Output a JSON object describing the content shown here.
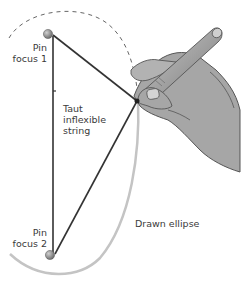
{
  "labels": {
    "pin_focus_1": [
      "Pin",
      "focus 1"
    ],
    "string": [
      "Taut",
      "inflexible",
      "string"
    ],
    "pin_focus_2": [
      "Pin",
      "focus 2"
    ],
    "ellipse": "Drawn ellipse"
  },
  "colors": {
    "string": "#333333",
    "ellipse": "#c4c4c4",
    "dashed_arc": "#666666",
    "pin": "#8a8a8a",
    "hand": "#a6a6a6",
    "pencil": "#9a9a9a",
    "label": "#3a3a3a"
  }
}
